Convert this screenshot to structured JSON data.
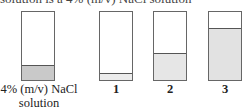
{
  "header": {
    "clipped_text": "solution is a 4% (m/v) NaCl solution"
  },
  "beakers": [
    {
      "id": "reference",
      "label_line1": "4% (m/v) NaCl",
      "label_line2": "solution",
      "fill_fraction": 0.2,
      "fill_color": "#c9c9c9"
    },
    {
      "id": "1",
      "label_line1": "1",
      "fill_fraction": 0.1,
      "fill_color": "#ececec"
    },
    {
      "id": "2",
      "label_line1": "2",
      "fill_fraction": 0.38,
      "fill_color": "#e6e6e6"
    },
    {
      "id": "3",
      "label_line1": "3",
      "fill_fraction": 0.75,
      "fill_color": "#e2e2e2"
    }
  ],
  "colors": {
    "outline": "#666666",
    "background": "#ffffff"
  }
}
